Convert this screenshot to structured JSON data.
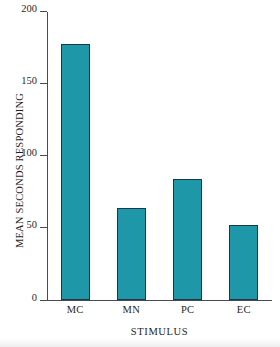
{
  "chart_data": {
    "type": "bar",
    "title": "",
    "categories": [
      "MC",
      "MN",
      "PC",
      "EC"
    ],
    "values": [
      177,
      64,
      84,
      52
    ],
    "xlabel": "STIMULUS",
    "ylabel": "MEAN SECONDS RESPONDING",
    "ylim": [
      0,
      200
    ],
    "yticks": [
      0,
      50,
      100,
      150,
      200
    ],
    "ytick_labels": [
      "0",
      "50",
      "100",
      "150",
      "200"
    ],
    "grid": false,
    "legend": false,
    "bar_color": "#1E97A8",
    "bar_edge_color": "#173A4A",
    "axis_color": "#4A4A4A",
    "background_color": "#FFFFFF"
  }
}
